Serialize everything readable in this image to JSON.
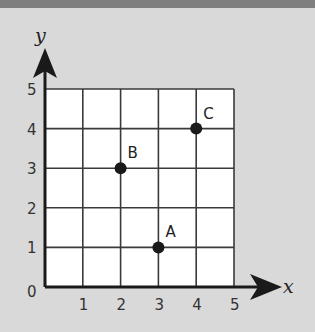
{
  "chart_data": {
    "type": "scatter",
    "title": "",
    "xlabel": "x",
    "ylabel": "y",
    "xlim": [
      0,
      5
    ],
    "ylim": [
      0,
      5
    ],
    "grid": true,
    "x_ticks": [
      "1",
      "2",
      "3",
      "4",
      "5"
    ],
    "y_ticks": [
      "1",
      "2",
      "3",
      "4",
      "5"
    ],
    "origin_label": "0",
    "points": [
      {
        "label": "A",
        "x": 3,
        "y": 1
      },
      {
        "label": "B",
        "x": 2,
        "y": 3
      },
      {
        "label": "C",
        "x": 4,
        "y": 4
      }
    ]
  },
  "colors": {
    "background": "#d9d9d9",
    "grid_fill": "#ffffff",
    "grid_line": "#333333",
    "point": "#1a1a1a",
    "top_bar": "#7f7f7f"
  }
}
